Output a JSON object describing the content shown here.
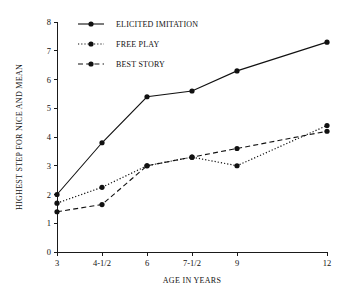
{
  "chart_data": {
    "type": "line",
    "title": "",
    "xlabel": "AGE IN YEARS",
    "ylabel": "HIGHEST STEP FOR NICE AND MEAN",
    "categories": [
      "3",
      "4-1/2",
      "6",
      "7-1/2",
      "9",
      "12"
    ],
    "x": [
      3,
      4.5,
      6,
      7.5,
      9,
      12
    ],
    "xlim": [
      3,
      12
    ],
    "ylim": [
      0,
      8
    ],
    "yticks": [
      "0",
      "1",
      "2",
      "3",
      "4",
      "5",
      "6",
      "7",
      "8"
    ],
    "ytick_values": [
      0,
      1,
      2,
      3,
      4,
      5,
      6,
      7,
      8
    ],
    "grid": false,
    "legend_position": "top-left",
    "series": [
      {
        "name": "ELICITED IMITATION",
        "style": "solid",
        "marker": "filled-circle",
        "values": [
          2.0,
          3.8,
          5.4,
          5.6,
          6.3,
          7.3
        ]
      },
      {
        "name": "FREE PLAY",
        "style": "dotted",
        "marker": "filled-circle",
        "values": [
          1.7,
          2.25,
          3.0,
          3.3,
          3.0,
          4.4
        ]
      },
      {
        "name": "BEST STORY",
        "style": "dashed",
        "marker": "filled-circle",
        "values": [
          1.4,
          1.65,
          3.0,
          3.3,
          3.6,
          4.2
        ]
      }
    ]
  }
}
